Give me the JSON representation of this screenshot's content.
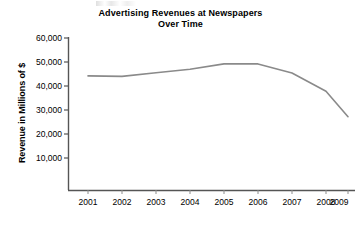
{
  "chart_data": {
    "type": "line",
    "title": "Advertising Revenues at Newspapers Over Time",
    "title_line1": "Advertising Revenues at Newspapers",
    "title_line2": "Over Time",
    "xlabel": "",
    "ylabel": "Revenue in Millions of $",
    "categories": [
      "2001",
      "2002",
      "2003",
      "2004",
      "2005",
      "2006",
      "2007",
      "2008",
      "2009"
    ],
    "x": [
      2001,
      2002,
      2003,
      2004,
      2005,
      2006,
      2007,
      2008,
      2009
    ],
    "values": [
      44200,
      44000,
      45500,
      47000,
      49200,
      49200,
      45400,
      37800,
      27200
    ],
    "series": [
      {
        "name": "Advertising Revenue",
        "values": [
          44200,
          44000,
          45500,
          47000,
          49200,
          49200,
          45400,
          37800,
          27200
        ]
      }
    ],
    "ylim": [
      0,
      60000
    ],
    "yticks": [
      10000,
      20000,
      30000,
      40000,
      50000,
      60000
    ],
    "ytick_labels": [
      "10,000",
      "20,000",
      "30,000",
      "40,000",
      "50,000",
      "60,000"
    ],
    "xtick_labels": [
      "2001",
      "2002",
      "2003",
      "2004",
      "2005",
      "2006",
      "2007",
      "2008",
      "2009"
    ],
    "grid": false,
    "legend": false,
    "legend_position": "none",
    "line_color": "#8a8a8a",
    "axis_color": "#555555",
    "background_color": "#ffffff"
  },
  "axis": {
    "y_labels": [
      "60,000",
      "50,000",
      "40,000",
      "30,000",
      "20,000",
      "10,000"
    ],
    "x_labels": [
      "2001",
      "2002",
      "2003",
      "2004",
      "2005",
      "2006",
      "2007",
      "2008",
      "2009"
    ]
  }
}
